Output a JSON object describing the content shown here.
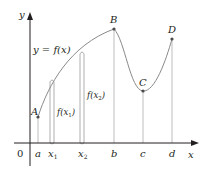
{
  "diagram": {
    "colors": {
      "axis": "#231f20",
      "curve": "#8a8a8a",
      "guide": "#bdbdbd",
      "point": "#4a4a4a"
    },
    "axes": {
      "x_label": "x",
      "y_label": "y",
      "origin_label": "0"
    },
    "curve_label": "y = f(x)",
    "points": [
      {
        "label": "A",
        "x_label": "a"
      },
      {
        "label": "B",
        "x_label": "b"
      },
      {
        "label": "C",
        "x_label": "c"
      },
      {
        "label": "D",
        "x_label": "d"
      }
    ],
    "ticks": {
      "a": "a",
      "x1": "x",
      "x1_sub": "1",
      "x2": "x",
      "x2_sub": "2",
      "b": "b",
      "c": "c",
      "d": "d"
    },
    "value_labels": {
      "fx1_f": "f(x",
      "fx1_sub": "1",
      "fx1_close": ")",
      "fx2_f": "f(x",
      "fx2_sub": "2",
      "fx2_close": ")"
    }
  }
}
